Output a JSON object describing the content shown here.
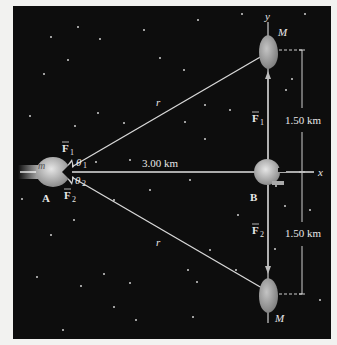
{
  "diagram": {
    "axes": {
      "x_label": "x",
      "y_label": "y"
    },
    "bodies": {
      "ship_A": {
        "mass_label": "m",
        "point_label": "A"
      },
      "point_B": {
        "point_label": "B"
      },
      "asteroid_top": {
        "mass_label": "M"
      },
      "asteroid_bottom": {
        "mass_label": "M"
      }
    },
    "forces": {
      "f1": "F⃗1",
      "f2": "F⃗2",
      "f1_sub": "1",
      "f2_sub": "2",
      "f_base": "F"
    },
    "angles": {
      "theta1_base": "θ",
      "theta1_sub": "1",
      "theta2_base": "θ",
      "theta2_sub": "2"
    },
    "distances": {
      "horizontal": "3.00 km",
      "upper_vertical": "1.50 km",
      "lower_vertical": "1.50 km",
      "r_upper": "r",
      "r_lower": "r"
    },
    "colors": {
      "background": "#0d0d0d",
      "frame": "#f2f2f0",
      "lines": "#d8d8d8",
      "bodies": "#b8b8b8"
    }
  }
}
